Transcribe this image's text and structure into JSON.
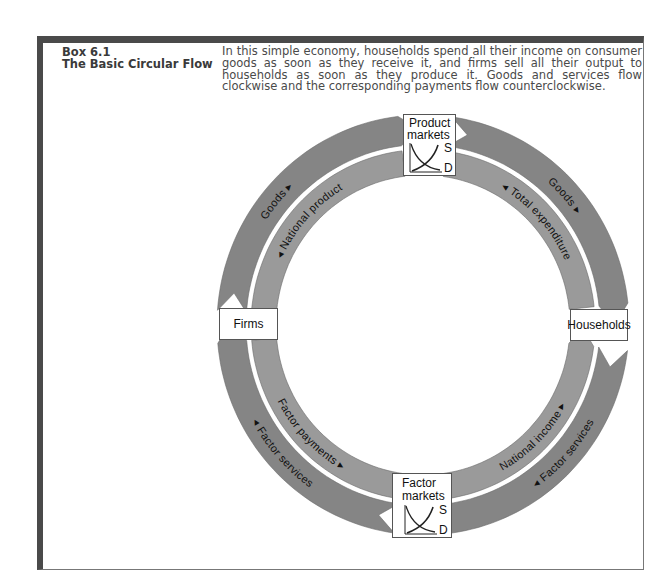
{
  "box": {
    "number": "Box 6.1",
    "title": "The Basic Circular Flow",
    "description": "In this simple economy, households spend all their income on consumer goods as soon as they receive it, and firms sell all their output to households as soon as they produce it. Goods and services flow clockwise and the corresponding payments flow counterclockwise."
  },
  "diagram": {
    "nodes": {
      "product_markets": {
        "line1": "Product",
        "line2": "markets",
        "supply": "S",
        "demand": "D"
      },
      "factor_markets": {
        "line1": "Factor",
        "line2": "markets",
        "supply": "S",
        "demand": "D"
      },
      "firms": "Firms",
      "households": "Households"
    },
    "flows": [
      {
        "id": "goods-left",
        "label": "Goods ▸",
        "ring": "outer",
        "direction": "clockwise",
        "from": "Firms",
        "to": "Product markets"
      },
      {
        "id": "goods-right",
        "label": "Goods ▸",
        "ring": "outer",
        "direction": "clockwise",
        "from": "Product markets",
        "to": "Households"
      },
      {
        "id": "factor-services-right",
        "label": "◂ Factor services",
        "ring": "outer",
        "direction": "clockwise",
        "from": "Households",
        "to": "Factor markets"
      },
      {
        "id": "factor-services-left",
        "label": "◂ Factor services",
        "ring": "outer",
        "direction": "clockwise",
        "from": "Factor markets",
        "to": "Firms"
      },
      {
        "id": "national-product",
        "label": "◂ National product",
        "ring": "inner",
        "direction": "counterclockwise",
        "from": "Product markets",
        "to": "Firms"
      },
      {
        "id": "total-expenditure",
        "label": "◂ Total expenditure",
        "ring": "inner",
        "direction": "counterclockwise",
        "from": "Households",
        "to": "Product markets"
      },
      {
        "id": "national-income",
        "label": "National income ▸",
        "ring": "inner",
        "direction": "counterclockwise",
        "from": "Factor markets",
        "to": "Households"
      },
      {
        "id": "factor-payments",
        "label": "Factor payments ▸",
        "ring": "inner",
        "direction": "counterclockwise",
        "from": "Firms",
        "to": "Factor markets"
      }
    ],
    "colors": {
      "outer_ring": "#858585",
      "inner_ring": "#9a9a9a",
      "frame": "#4a4a4a"
    }
  }
}
